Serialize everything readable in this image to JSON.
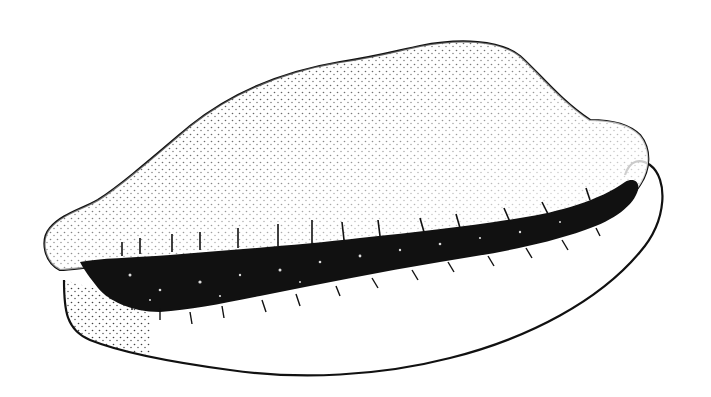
{
  "illustration": {
    "subject": "cowrie shell",
    "style": "stippled pen-and-ink line drawing",
    "colors": {
      "background": "#ffffff",
      "ink": "#111111"
    }
  }
}
